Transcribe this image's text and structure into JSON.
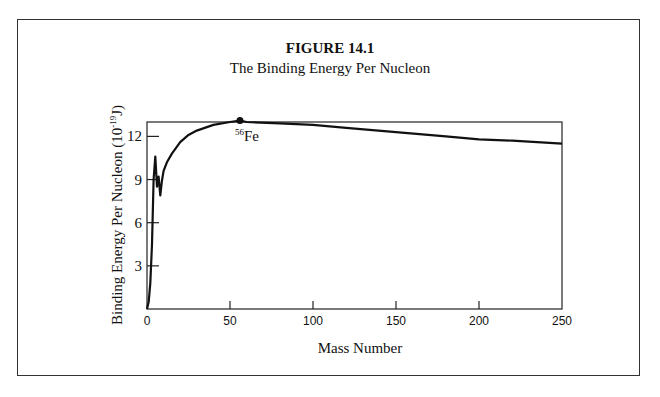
{
  "figure": {
    "label": "FIGURE 14.1",
    "subtitle": "The Binding Energy Per Nucleon"
  },
  "axes": {
    "ylabel_main": "Binding Energy Per Nucleon (10",
    "ylabel_exp": "-19",
    "ylabel_unit": "J)",
    "xlabel": "Mass Number",
    "xticks": [
      "0",
      "50",
      "100",
      "150",
      "200",
      "250"
    ],
    "yticks": [
      "3",
      "6",
      "9",
      "12"
    ]
  },
  "annotation": {
    "isotope_mass": "56",
    "isotope_symbol": "Fe"
  },
  "chart_data": {
    "type": "line",
    "title": "FIGURE 14.1",
    "subtitle": "The Binding Energy Per Nucleon",
    "xlabel": "Mass Number",
    "ylabel": "Binding Energy Per Nucleon (10^-19 J)",
    "xlim": [
      0,
      250
    ],
    "ylim": [
      0,
      13
    ],
    "xticks": [
      0,
      50,
      100,
      150,
      200,
      250
    ],
    "yticks": [
      3,
      6,
      9,
      12
    ],
    "grid": false,
    "legend": null,
    "series": [
      {
        "name": "Binding energy per nucleon",
        "x": [
          1,
          2,
          3,
          4,
          5,
          6,
          7,
          8,
          9,
          10,
          12,
          15,
          20,
          25,
          30,
          40,
          50,
          56,
          60,
          80,
          100,
          120,
          150,
          180,
          200,
          220,
          250
        ],
        "y": [
          0.5,
          1.8,
          4.5,
          9.0,
          10.6,
          8.5,
          9.2,
          7.9,
          8.9,
          9.6,
          10.2,
          10.8,
          11.6,
          12.1,
          12.4,
          12.8,
          13.0,
          13.1,
          13.0,
          12.9,
          12.8,
          12.6,
          12.3,
          12.0,
          11.8,
          11.7,
          11.5
        ]
      }
    ],
    "annotations": [
      {
        "text": "56Fe",
        "x": 56,
        "y": 13.1,
        "marker": "dot"
      }
    ]
  }
}
